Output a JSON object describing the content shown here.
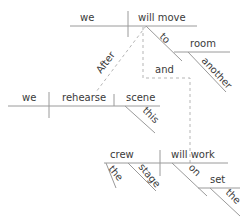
{
  "diagram": {
    "type": "sentence-diagram",
    "main_clause": {
      "subject": "we",
      "verb": "will move",
      "prep": "to",
      "object": "room",
      "object_modifier": "another"
    },
    "subordinate_clause_1": {
      "conjunction": "After",
      "subject": "we",
      "verb": "rehearse",
      "object": "scene",
      "object_modifier": "this"
    },
    "subordinate_clause_2": {
      "conjunction": "and",
      "subject": "crew",
      "subject_modifiers": [
        "the",
        "stage"
      ],
      "verb": "will work",
      "prep": "on",
      "object": "set",
      "object_modifier": "the"
    }
  }
}
